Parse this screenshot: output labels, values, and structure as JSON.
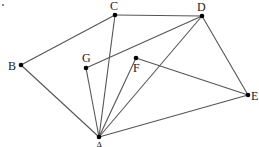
{
  "diagram": {
    "type": "geometric-graph",
    "points": {
      "A": {
        "label": "A",
        "x": 99,
        "y": 137,
        "lx": 95,
        "ly": 150
      },
      "B": {
        "label": "B",
        "x": 21,
        "y": 65,
        "lx": 8,
        "ly": 70
      },
      "C": {
        "label": "C",
        "x": 115,
        "y": 15,
        "lx": 110,
        "ly": 10
      },
      "D": {
        "label": "D",
        "x": 202,
        "y": 16,
        "lx": 197,
        "ly": 11
      },
      "E": {
        "label": "E",
        "x": 248,
        "y": 95,
        "lx": 251,
        "ly": 100
      },
      "F": {
        "label": "F",
        "x": 136,
        "y": 58,
        "lx": 133,
        "ly": 72
      },
      "G": {
        "label": "G",
        "x": 86,
        "y": 68,
        "lx": 82,
        "ly": 62
      }
    },
    "edges": [
      [
        "B",
        "C"
      ],
      [
        "C",
        "D"
      ],
      [
        "B",
        "A"
      ],
      [
        "C",
        "A"
      ],
      [
        "G",
        "D"
      ],
      [
        "G",
        "A"
      ],
      [
        "D",
        "A"
      ],
      [
        "D",
        "E"
      ],
      [
        "F",
        "A"
      ],
      [
        "F",
        "E"
      ],
      [
        "A",
        "E"
      ]
    ],
    "colors": {
      "edge": "#555555",
      "vertex": "#000000",
      "label": "#222222"
    }
  }
}
